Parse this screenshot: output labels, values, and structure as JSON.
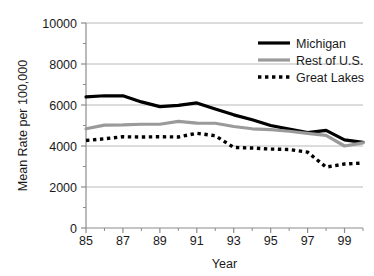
{
  "chart_data": {
    "type": "line",
    "title": "",
    "xlabel": "Year",
    "ylabel": "Mean Rate per 100,000",
    "xlim": [
      85,
      100
    ],
    "ylim": [
      0,
      10000
    ],
    "grid": true,
    "grid_axis": "y",
    "legend_position": "top-right",
    "x": [
      85,
      86,
      87,
      88,
      89,
      90,
      91,
      92,
      93,
      94,
      95,
      96,
      97,
      98,
      99,
      100
    ],
    "xtick_labels": [
      "85",
      "",
      "87",
      "",
      "89",
      "",
      "91",
      "",
      "93",
      "",
      "95",
      "",
      "97",
      "",
      "99",
      ""
    ],
    "xtick_major": [
      "85",
      "87",
      "89",
      "91",
      "93",
      "95",
      "97",
      "99"
    ],
    "ytick_labels": [
      "0",
      "2000",
      "4000",
      "6000",
      "8000",
      "10000"
    ],
    "ytick_values": [
      0,
      2000,
      4000,
      6000,
      8000,
      10000
    ],
    "series": [
      {
        "name": "Michigan",
        "color": "#000000",
        "style": "solid",
        "width": 3.2,
        "values": [
          6400,
          6450,
          6450,
          6150,
          5920,
          5980,
          6100,
          5800,
          5520,
          5280,
          5000,
          4820,
          4650,
          4760,
          4300,
          4180
        ]
      },
      {
        "name": "Rest of U.S.",
        "color": "#9a9a9a",
        "style": "solid",
        "width": 3.2,
        "values": [
          4840,
          5020,
          5030,
          5060,
          5060,
          5200,
          5120,
          5110,
          4950,
          4840,
          4800,
          4720,
          4620,
          4520,
          4000,
          4150
        ]
      },
      {
        "name": "Great Lakes",
        "color": "#000000",
        "style": "dotted",
        "width": 3.4,
        "values": [
          4270,
          4350,
          4450,
          4440,
          4450,
          4440,
          4620,
          4500,
          3930,
          3900,
          3850,
          3830,
          3700,
          2970,
          3120,
          3170
        ]
      }
    ]
  },
  "legend": {
    "items": [
      {
        "label": "Michigan"
      },
      {
        "label": "Rest of U.S."
      },
      {
        "label": "Great Lakes"
      }
    ]
  },
  "colors": {
    "michigan": "#000000",
    "rest_of_us": "#9a9a9a",
    "great_lakes": "#000000",
    "grid": "#b8b8b8",
    "axis": "#8c8c8c",
    "background": "#ffffff"
  }
}
